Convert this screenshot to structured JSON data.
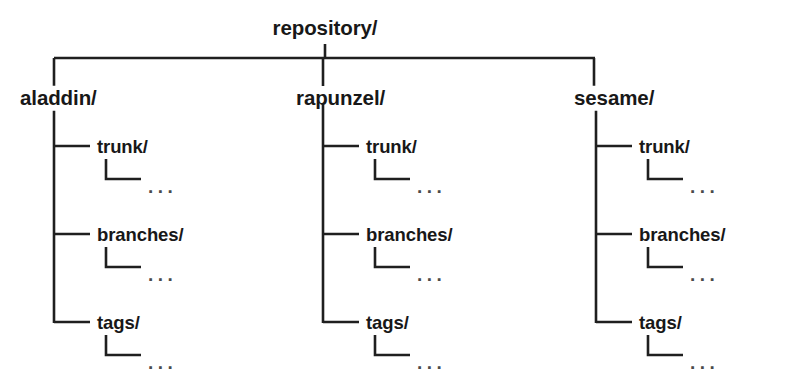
{
  "diagram": {
    "type": "tree",
    "title": "repository/",
    "root": {
      "label": "repository/"
    },
    "ellipsis": "...",
    "colors": {
      "line": "#1f1f1f",
      "text": "#181818",
      "ellipsis": "#4a4a4a",
      "background": "#ffffff"
    },
    "columns": [
      {
        "label": "aladdin/",
        "children": [
          {
            "label": "trunk/",
            "detail": "..."
          },
          {
            "label": "branches/",
            "detail": "..."
          },
          {
            "label": "tags/",
            "detail": "..."
          }
        ]
      },
      {
        "label": "rapunzel/",
        "children": [
          {
            "label": "trunk/",
            "detail": "..."
          },
          {
            "label": "branches/",
            "detail": "..."
          },
          {
            "label": "tags/",
            "detail": "..."
          }
        ]
      },
      {
        "label": "sesame/",
        "children": [
          {
            "label": "trunk/",
            "detail": "..."
          },
          {
            "label": "branches/",
            "detail": "..."
          },
          {
            "label": "tags/",
            "detail": "..."
          }
        ]
      }
    ]
  }
}
